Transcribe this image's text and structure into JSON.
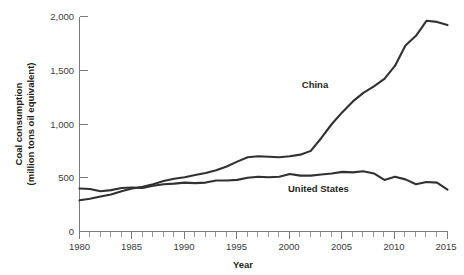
{
  "chart_data": {
    "type": "line",
    "title": "",
    "xlabel": "Year",
    "ylabel": "Coal consumption (million tons oil equivalent)",
    "ylabel_line1": "Coal consumption",
    "ylabel_line2": "(million tons oil equivalent)",
    "xlim": [
      1980,
      2015
    ],
    "ylim": [
      0,
      2000
    ],
    "grid": false,
    "legend_position": "inline-annotation",
    "x_tick_labels": [
      "1980",
      "1985",
      "1990",
      "1995",
      "2000",
      "2005",
      "2010",
      "2015"
    ],
    "x_tick_values": [
      1980,
      1985,
      1990,
      1995,
      2000,
      2005,
      2010,
      2015
    ],
    "x_minor_tick_step": 1,
    "y_tick_labels": [
      "0",
      "500",
      "1,000",
      "1,500",
      "2,000"
    ],
    "y_tick_values": [
      0,
      500,
      1000,
      1500,
      2000
    ],
    "x": [
      1980,
      1981,
      1982,
      1983,
      1984,
      1985,
      1986,
      1987,
      1988,
      1989,
      1990,
      1991,
      1992,
      1993,
      1994,
      1995,
      1996,
      1997,
      1998,
      1999,
      2000,
      2001,
      2002,
      2003,
      2004,
      2005,
      2006,
      2007,
      2008,
      2009,
      2010,
      2011,
      2012,
      2013,
      2014,
      2015
    ],
    "series": [
      {
        "name": "China",
        "label": "China",
        "color": "#333033",
        "values": [
          290,
          305,
          325,
          345,
          375,
          400,
          415,
          440,
          470,
          490,
          505,
          525,
          545,
          570,
          605,
          650,
          690,
          700,
          695,
          690,
          700,
          715,
          750,
          870,
          1000,
          1110,
          1210,
          1290,
          1350,
          1420,
          1540,
          1730,
          1820,
          1960,
          1950,
          1920
        ]
      },
      {
        "name": "United States",
        "label": "United States",
        "color": "#333033",
        "values": [
          400,
          395,
          375,
          385,
          405,
          410,
          405,
          425,
          440,
          445,
          455,
          450,
          455,
          475,
          475,
          480,
          500,
          510,
          505,
          510,
          535,
          520,
          520,
          530,
          540,
          555,
          550,
          560,
          540,
          480,
          510,
          485,
          440,
          460,
          455,
          390
        ]
      }
    ],
    "annotations": [
      {
        "text": "China",
        "x_px": 315,
        "y_px": 88
      },
      {
        "text": "United States",
        "x_px": 288,
        "y_px": 192
      }
    ]
  },
  "axis": {
    "x_title": "Year",
    "y_title_line1": "Coal consumption",
    "y_title_line2": "(million tons oil equivalent)"
  },
  "ticks": {
    "y": [
      "2,000",
      "1,500",
      "1,000",
      "500",
      "0"
    ],
    "x": [
      "1980",
      "1985",
      "1990",
      "1995",
      "2000",
      "2005",
      "2010",
      "2015"
    ]
  },
  "labels": {
    "china": "China",
    "united_states": "United States"
  },
  "colors": {
    "line": "#333033",
    "axis": "#7a7a7a",
    "text": "#231f20",
    "tick_text": "#3b3b3b",
    "background": "#ffffff"
  }
}
